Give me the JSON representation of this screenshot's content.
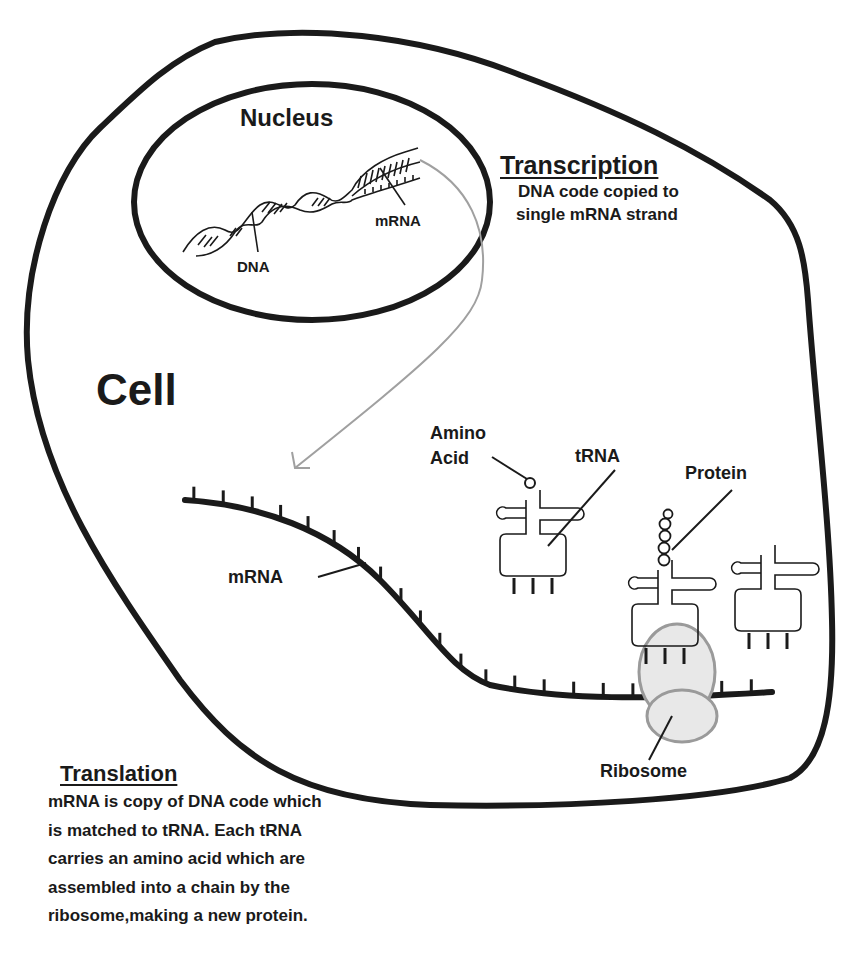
{
  "diagram": {
    "title": "Cell",
    "nucleus": {
      "label": "Nucleus",
      "dna_label": "DNA",
      "mrna_label": "mRNA"
    },
    "transcription": {
      "heading": "Transcription",
      "lines": [
        "DNA code copied to",
        "single mRNA strand"
      ]
    },
    "cytoplasm": {
      "mrna_label": "mRNA",
      "amino_acid_label_line1": "Amino",
      "amino_acid_label_line2": "Acid",
      "trna_label": "tRNA",
      "protein_label": "Protein",
      "ribosome_label": "Ribosome"
    },
    "translation": {
      "heading": "Translation",
      "lines": [
        "mRNA is copy of DNA code which",
        "is matched to tRNA. Each tRNA",
        "carries an amino acid which are",
        "assembled into a chain by the",
        "ribosome,making a new protein."
      ]
    },
    "colors": {
      "outline": "#1a1a1a",
      "arrow": "#a0a0a0",
      "ribosome_fill": "#e8e8e8",
      "ribosome_stroke": "#9a9a9a"
    }
  }
}
